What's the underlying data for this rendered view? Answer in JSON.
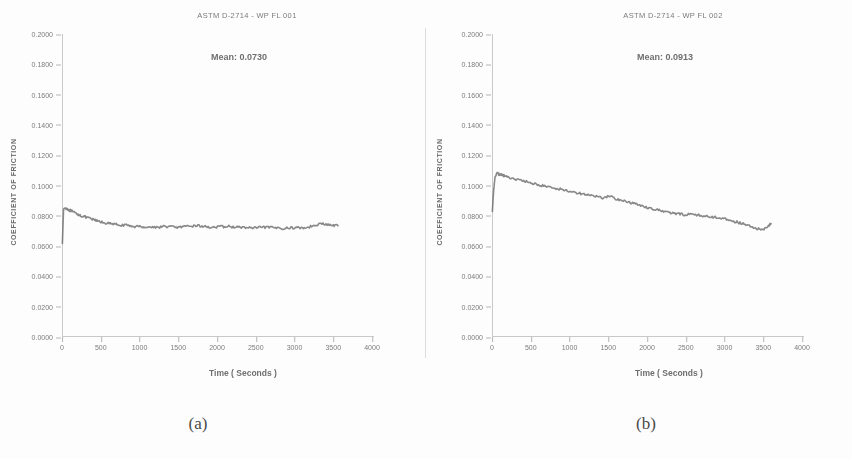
{
  "figure": {
    "panels": [
      {
        "caption": "(a)",
        "title": "ASTM D-2714 - WP FL 001",
        "mean_label": "Mean:  0.0730"
      },
      {
        "caption": "(b)",
        "title": "ASTM D-2714 - WP FL 002",
        "mean_label": "Mean:  0.0913"
      }
    ]
  },
  "chart_data": [
    {
      "type": "line",
      "title": "ASTM D-2714 - WP FL 001",
      "xlabel": "Time ( Seconds )",
      "ylabel": "COEFFICIENT OF FRICTION",
      "xlim": [
        0,
        4000
      ],
      "ylim": [
        0.0,
        0.2
      ],
      "grid": false,
      "legend": null,
      "annotations": [
        "Mean:  0.0730"
      ],
      "xticks": [
        "0",
        "500",
        "1000",
        "1500",
        "2000",
        "2500",
        "3000",
        "3500",
        "4000"
      ],
      "yticks": [
        "0.0000",
        "0.0200",
        "0.0400",
        "0.0600",
        "0.0800",
        "0.1000",
        "0.1200",
        "0.1400",
        "0.1600",
        "0.1800",
        "0.2000"
      ],
      "series": [
        {
          "name": "Coefficient of friction",
          "x": [
            5,
            20,
            40,
            60,
            90,
            120,
            160,
            200,
            250,
            300,
            360,
            420,
            480,
            550,
            620,
            700,
            780,
            860,
            940,
            1020,
            1100,
            1180,
            1260,
            1340,
            1420,
            1500,
            1580,
            1660,
            1740,
            1820,
            1900,
            1980,
            2060,
            2140,
            2220,
            2300,
            2380,
            2460,
            2540,
            2620,
            2700,
            2780,
            2860,
            2940,
            3020,
            3100,
            3180,
            3260,
            3340,
            3420,
            3500,
            3560
          ],
          "y": [
            0.062,
            0.0845,
            0.0852,
            0.0848,
            0.0838,
            0.0832,
            0.082,
            0.0812,
            0.08,
            0.0792,
            0.0782,
            0.0772,
            0.0762,
            0.0754,
            0.0748,
            0.0742,
            0.0738,
            0.0734,
            0.073,
            0.0728,
            0.0726,
            0.0724,
            0.0726,
            0.073,
            0.0728,
            0.0724,
            0.0726,
            0.0732,
            0.0736,
            0.073,
            0.0726,
            0.0724,
            0.0728,
            0.073,
            0.0726,
            0.0724,
            0.0722,
            0.072,
            0.0722,
            0.0724,
            0.0722,
            0.072,
            0.0718,
            0.072,
            0.0722,
            0.072,
            0.0724,
            0.074,
            0.0748,
            0.0742,
            0.0736,
            0.0734
          ]
        }
      ]
    },
    {
      "type": "line",
      "title": "ASTM D-2714 - WP FL 002",
      "xlabel": "Time ( Seconds )",
      "ylabel": "COEFFICIENT OF FRICTION",
      "xlim": [
        0,
        4000
      ],
      "ylim": [
        0.0,
        0.2
      ],
      "grid": false,
      "legend": null,
      "annotations": [
        "Mean:  0.0913"
      ],
      "xticks": [
        "0",
        "500",
        "1000",
        "1500",
        "2000",
        "2500",
        "3000",
        "3500",
        "4000"
      ],
      "yticks": [
        "0.0000",
        "0.0200",
        "0.0400",
        "0.0600",
        "0.0800",
        "0.1000",
        "0.1200",
        "0.1400",
        "0.1600",
        "0.1800",
        "0.2000"
      ],
      "series": [
        {
          "name": "Coefficient of friction",
          "x": [
            5,
            20,
            40,
            70,
            100,
            140,
            180,
            230,
            290,
            350,
            420,
            490,
            560,
            640,
            720,
            800,
            880,
            960,
            1040,
            1120,
            1200,
            1280,
            1360,
            1440,
            1520,
            1600,
            1680,
            1760,
            1840,
            1920,
            2000,
            2080,
            2160,
            2240,
            2320,
            2400,
            2480,
            2560,
            2640,
            2720,
            2800,
            2880,
            2960,
            3040,
            3120,
            3200,
            3280,
            3360,
            3440,
            3500,
            3560,
            3600
          ],
          "y": [
            0.083,
            0.096,
            0.1065,
            0.108,
            0.1072,
            0.1068,
            0.106,
            0.1052,
            0.1044,
            0.1036,
            0.1028,
            0.1018,
            0.101,
            0.1,
            0.0992,
            0.0984,
            0.0976,
            0.0968,
            0.0958,
            0.095,
            0.0942,
            0.0934,
            0.0926,
            0.0918,
            0.093,
            0.0912,
            0.09,
            0.089,
            0.088,
            0.0868,
            0.0856,
            0.0846,
            0.0836,
            0.0826,
            0.0818,
            0.0812,
            0.0808,
            0.0812,
            0.0806,
            0.08,
            0.0794,
            0.079,
            0.0786,
            0.0776,
            0.0764,
            0.0752,
            0.074,
            0.0724,
            0.0712,
            0.0708,
            0.073,
            0.0748
          ]
        }
      ]
    }
  ]
}
